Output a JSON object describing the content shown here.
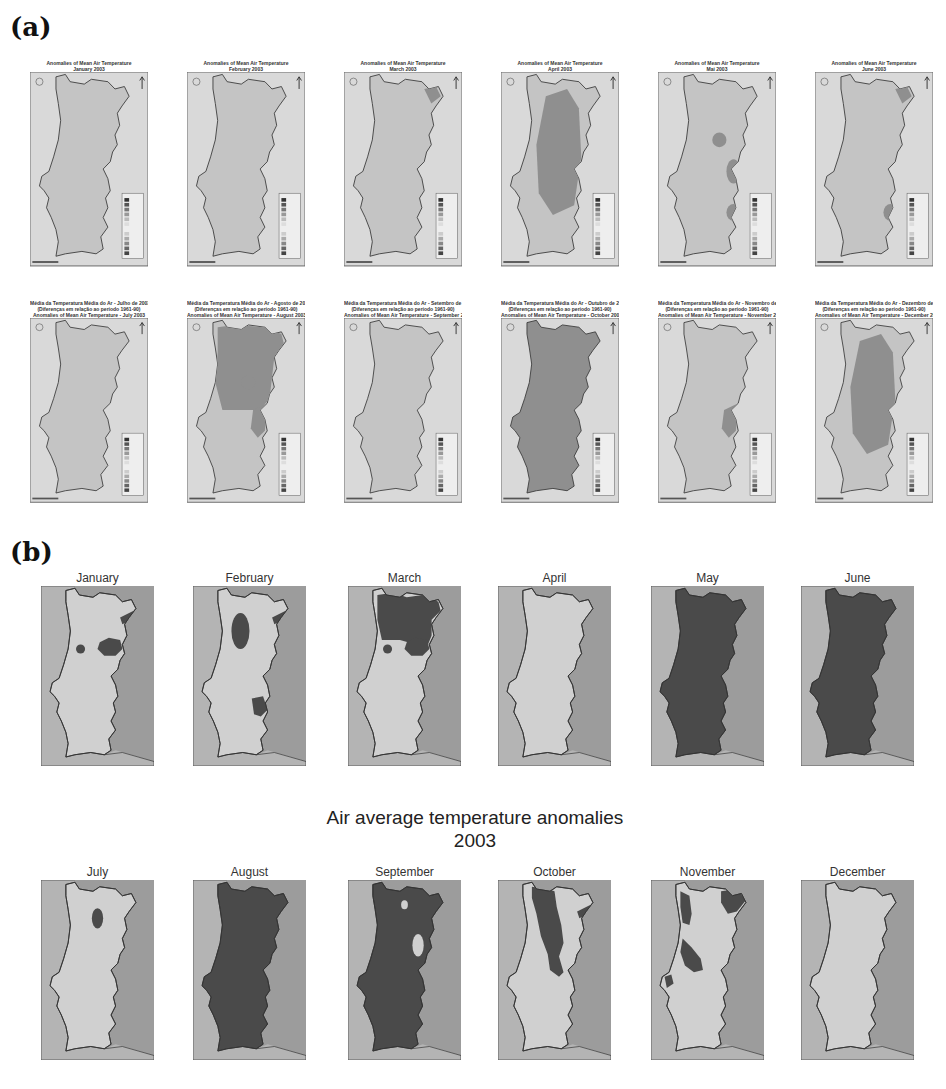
{
  "panel_a": {
    "label": "(a)",
    "maps": [
      {
        "title_lines": [
          "Anomalies of Mean Air Temperature",
          "January 2003"
        ],
        "anomaly_regions": []
      },
      {
        "title_lines": [
          "Anomalies of Mean Air Temperature",
          "February 2003"
        ],
        "anomaly_regions": []
      },
      {
        "title_lines": [
          "Anomalies of Mean Air Temperature",
          "March 2003"
        ],
        "anomaly_regions": [
          "northeast"
        ]
      },
      {
        "title_lines": [
          "Anomalies of Mean Air Temperature",
          "April 2003"
        ],
        "anomaly_regions": [
          "interior"
        ]
      },
      {
        "title_lines": [
          "Anomalies of Mean Air Temperature",
          "Mai 2003"
        ],
        "anomaly_regions": [
          "center",
          "east-center",
          "southeast"
        ]
      },
      {
        "title_lines": [
          "Anomalies of Mean Air Temperature",
          "June 2003"
        ],
        "anomaly_regions": [
          "northeast",
          "southeast"
        ]
      },
      {
        "title_lines": [
          "Média da Temperatura Média do Ar - Julho de 2003",
          "(Diferenças em relação ao período 1961-90)",
          "Anomalies of Mean Air Temperature - July 2003"
        ],
        "anomaly_regions": []
      },
      {
        "title_lines": [
          "Média da Temperatura Média do Ar - Agosto de 2003",
          "(Diferenças em relação ao período 1961-90)",
          "Anomalies of Mean Air Temperature - August 2003"
        ],
        "anomaly_regions": [
          "north",
          "center",
          "east"
        ]
      },
      {
        "title_lines": [
          "Média da Temperatura Média do Ar - Setembro de 2003",
          "(Diferenças em relação ao período 1961-90)",
          "Anomalies of Mean Air Temperature - September 2003"
        ],
        "anomaly_regions": []
      },
      {
        "title_lines": [
          "Média da Temperatura Média do Ar - Outubro de 2003",
          "(Diferenças em relação ao período 1961-90)",
          "Anomalies of Mean Air Temperature - October 2003"
        ],
        "anomaly_regions": [
          "whole"
        ]
      },
      {
        "title_lines": [
          "Média da Temperatura Média do Ar - Novembro de 2003",
          "(Diferenças em relação ao período 1961-90)",
          "Anomalies of Mean Air Temperature - November 2003"
        ],
        "anomaly_regions": [
          "east"
        ]
      },
      {
        "title_lines": [
          "Média da Temperatura Média do Ar - Dezembro de 2003",
          "(Diferenças em relação ao período 1961-90)",
          "Anomalies of Mean Air Temperature - December 2003"
        ],
        "anomaly_regions": [
          "interior"
        ]
      }
    ],
    "legend_unit": "°C",
    "legend_classes": [
      "> 5",
      "4 - 5",
      "3 - 4",
      "2 - 3",
      "1 - 2",
      "0 - 1",
      "-1 - 0",
      "-2 - -1",
      "-3 - -2",
      "-4 - -3",
      "-5 - -4",
      "< -5"
    ],
    "city_labels": [
      "Porto",
      "Lisboa",
      "Faro"
    ]
  },
  "panel_b": {
    "label": "(b)",
    "center_title": [
      "Air average temperature anomalies",
      "2003"
    ],
    "months": [
      {
        "name": "January",
        "anomaly_regions": [
          "small-center-spot",
          "east-center",
          "northeast-tip"
        ]
      },
      {
        "name": "February",
        "anomaly_regions": [
          "north-interior",
          "northeast-tip",
          "southeast"
        ]
      },
      {
        "name": "March",
        "anomaly_regions": [
          "north",
          "small-center-spot",
          "east-center"
        ]
      },
      {
        "name": "April",
        "anomaly_regions": []
      },
      {
        "name": "May",
        "anomaly_regions": [
          "whole-country"
        ]
      },
      {
        "name": "June",
        "anomaly_regions": [
          "whole-country"
        ]
      },
      {
        "name": "July",
        "anomaly_regions": [
          "north-interior-spot"
        ]
      },
      {
        "name": "August",
        "anomaly_regions": [
          "whole-country"
        ]
      },
      {
        "name": "September",
        "anomaly_regions": [
          "whole-country-except-interior-gaps"
        ]
      },
      {
        "name": "October",
        "anomaly_regions": [
          "north-interior-band",
          "northeast-tip"
        ]
      },
      {
        "name": "November",
        "anomaly_regions": [
          "northwest-coast",
          "northeast",
          "west-center",
          "lisbon-area"
        ]
      },
      {
        "name": "December",
        "anomaly_regions": []
      }
    ]
  },
  "colors": {
    "sea": "#b4b4b4",
    "spain": "#9c9c9c",
    "land_light": "#d0d0d0",
    "anomaly_dark": "#4a4a4a",
    "a_sea": "#d9d9d9",
    "a_land": "#c4c4c4",
    "a_anomaly": "#8f8f8f",
    "border": "#333333"
  }
}
